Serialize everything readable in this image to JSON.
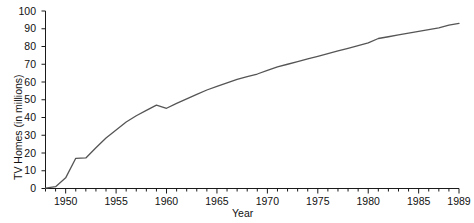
{
  "chart_data": {
    "type": "line",
    "title": "",
    "xlabel": "Year",
    "ylabel": "TV Homes (in millions)",
    "xlim": [
      1948,
      1989
    ],
    "ylim": [
      0,
      100
    ],
    "grid": false,
    "legend": "none",
    "series_color": "#555555",
    "axis_color": "#1a1a1a",
    "y_ticks": [
      0,
      10,
      20,
      30,
      40,
      50,
      60,
      70,
      80,
      90,
      100
    ],
    "y_tick_labels": [
      "0",
      "10",
      "20",
      "30",
      "40",
      "50",
      "60",
      "70",
      "80",
      "90",
      "100"
    ],
    "x_ticks": [
      1948,
      1949,
      1950,
      1951,
      1952,
      1953,
      1954,
      1955,
      1956,
      1957,
      1958,
      1959,
      1960,
      1961,
      1962,
      1963,
      1964,
      1965,
      1966,
      1967,
      1968,
      1969,
      1970,
      1971,
      1972,
      1973,
      1974,
      1975,
      1976,
      1977,
      1978,
      1979,
      1980,
      1981,
      1982,
      1983,
      1984,
      1985,
      1986,
      1987,
      1988,
      1989
    ],
    "x_major_ticks": [
      1950,
      1955,
      1960,
      1965,
      1970,
      1975,
      1980,
      1985,
      1989
    ],
    "x_tick_labels": [
      "1950",
      "1955",
      "1960",
      "1965",
      "1970",
      "1975",
      "1980",
      "1985",
      "1989"
    ],
    "x": [
      1948,
      1949,
      1950,
      1951,
      1952,
      1953,
      1954,
      1955,
      1956,
      1957,
      1958,
      1959,
      1960,
      1961,
      1962,
      1963,
      1964,
      1965,
      1966,
      1967,
      1968,
      1969,
      1970,
      1971,
      1972,
      1973,
      1974,
      1975,
      1976,
      1977,
      1978,
      1979,
      1980,
      1981,
      1982,
      1983,
      1984,
      1985,
      1986,
      1987,
      1988,
      1989
    ],
    "values": [
      0.2,
      1.0,
      6.0,
      17.0,
      17.2,
      23.0,
      28.5,
      33.0,
      37.5,
      41.0,
      44.0,
      47.0,
      45.2,
      48.0,
      50.5,
      53.0,
      55.5,
      57.5,
      59.5,
      61.5,
      63.0,
      64.5,
      66.5,
      68.5,
      70.0,
      71.5,
      73.0,
      74.5,
      76.0,
      77.5,
      79.0,
      80.5,
      82.0,
      84.5,
      85.5,
      86.5,
      87.5,
      88.5,
      89.5,
      90.5,
      92.0,
      93.0
    ]
  }
}
